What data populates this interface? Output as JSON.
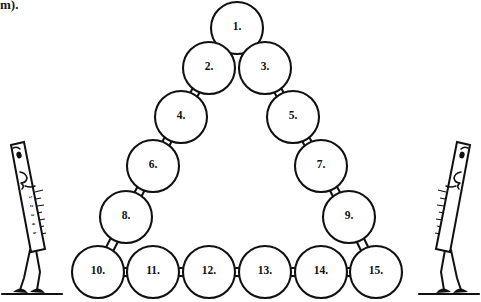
{
  "page": {
    "width": 481,
    "height": 302,
    "background_color": "#ffffff",
    "ink_color": "#111111"
  },
  "caption": {
    "fragment_text": "m).",
    "note": "partially cropped text at top-left edge"
  },
  "diagram": {
    "title_semantic": "triangular arrangement of fifteen numbered circles",
    "circle_radius": 26,
    "stroke_color": "#111111",
    "fill_color": "#ffffff",
    "nodes": [
      {
        "label": "1.",
        "cx": 237,
        "cy": 28,
        "row": 1,
        "col": 1
      },
      {
        "label": "2.",
        "cx": 209,
        "cy": 68,
        "row": 2,
        "col": 1
      },
      {
        "label": "3.",
        "cx": 265,
        "cy": 68,
        "row": 2,
        "col": 2
      },
      {
        "label": "4.",
        "cx": 181,
        "cy": 117,
        "row": 3,
        "col": 1
      },
      {
        "label": "5.",
        "cx": 293,
        "cy": 117,
        "row": 3,
        "col": 3
      },
      {
        "label": "6.",
        "cx": 153,
        "cy": 166,
        "row": 4,
        "col": 1
      },
      {
        "label": "7.",
        "cx": 321,
        "cy": 166,
        "row": 4,
        "col": 4
      },
      {
        "label": "8.",
        "cx": 126,
        "cy": 217,
        "row": 5,
        "col": 1
      },
      {
        "label": "9.",
        "cx": 349,
        "cy": 217,
        "row": 5,
        "col": 5
      },
      {
        "label": "10.",
        "cx": 98,
        "cy": 272,
        "row": 6,
        "col": 1
      },
      {
        "label": "11.",
        "cx": 153,
        "cy": 272,
        "row": 6,
        "col": 2
      },
      {
        "label": "12.",
        "cx": 209,
        "cy": 272,
        "row": 6,
        "col": 3
      },
      {
        "label": "13.",
        "cx": 265,
        "cy": 272,
        "row": 6,
        "col": 4
      },
      {
        "label": "14.",
        "cx": 321,
        "cy": 272,
        "row": 6,
        "col": 5
      },
      {
        "label": "15.",
        "cx": 376,
        "cy": 272,
        "row": 6,
        "col": 6
      }
    ],
    "links": [
      {
        "from": "1.",
        "to": "2.",
        "kind": "diagonal"
      },
      {
        "from": "1.",
        "to": "3.",
        "kind": "diagonal"
      },
      {
        "from": "2.",
        "to": "4.",
        "kind": "diagonal"
      },
      {
        "from": "3.",
        "to": "5.",
        "kind": "diagonal"
      },
      {
        "from": "4.",
        "to": "6.",
        "kind": "diagonal"
      },
      {
        "from": "5.",
        "to": "7.",
        "kind": "diagonal"
      },
      {
        "from": "6.",
        "to": "8.",
        "kind": "diagonal"
      },
      {
        "from": "7.",
        "to": "9.",
        "kind": "diagonal"
      },
      {
        "from": "8.",
        "to": "10.",
        "kind": "diagonal"
      },
      {
        "from": "9.",
        "to": "15.",
        "kind": "diagonal"
      },
      {
        "from": "10.",
        "to": "11.",
        "kind": "horizontal"
      },
      {
        "from": "11.",
        "to": "12.",
        "kind": "horizontal"
      },
      {
        "from": "12.",
        "to": "13.",
        "kind": "horizontal"
      },
      {
        "from": "13.",
        "to": "14.",
        "kind": "horizontal"
      },
      {
        "from": "14.",
        "to": "15.",
        "kind": "horizontal"
      }
    ]
  },
  "figures": [
    {
      "name": "left-ruler-character",
      "side": "left",
      "description": "tall slanted ruler with a face, leaning right, standing on two legs",
      "ruler_digits": [
        "1",
        "2",
        "3",
        "4",
        "5",
        "6"
      ],
      "ground_y": 294
    },
    {
      "name": "right-ruler-character",
      "side": "right",
      "description": "tall slanted ruler with a face, leaning left, standing on two legs",
      "ruler_digits": [
        "1",
        "2",
        "3",
        "4",
        "5",
        "6"
      ],
      "ground_y": 294
    }
  ]
}
